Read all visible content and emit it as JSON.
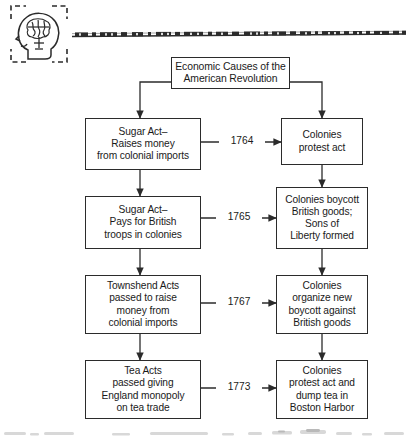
{
  "page": {
    "kind": "scanned-textbook-flowchart",
    "background_color": "#ffffff",
    "ink_color": "#2b2b2b"
  },
  "header": {
    "icon_name": "head-with-brain-icon",
    "icon_frame": "dashed-corner-brackets",
    "rule_name": "decorative-scan-rule"
  },
  "flowchart": {
    "title_node": {
      "label": "Economic Causes of the\nAmerican Revolution"
    },
    "left_column": [
      {
        "label": "Sugar Act–\nRaises money\nfrom colonial imports"
      },
      {
        "label": "Sugar Act–\nPays for British\ntroops in colonies"
      },
      {
        "label": "Townshend Acts\npassed to raise\nmoney from\ncolonial imports"
      },
      {
        "label": "Tea Acts\npassed giving\nEngland monopoly\non tea trade"
      }
    ],
    "right_column": [
      {
        "label": "Colonies\nprotest act"
      },
      {
        "label": "Colonies boycott\nBritish goods;\nSons of\nLiberty formed"
      },
      {
        "label": "Colonies\norganize new\nboycott against\nBritish goods"
      },
      {
        "label": "Colonies\nprotest act and\ndump tea in\nBoston Harbor"
      }
    ],
    "year_labels": [
      {
        "label": "1764"
      },
      {
        "label": "1765"
      },
      {
        "label": "1767"
      },
      {
        "label": "1773"
      }
    ]
  }
}
